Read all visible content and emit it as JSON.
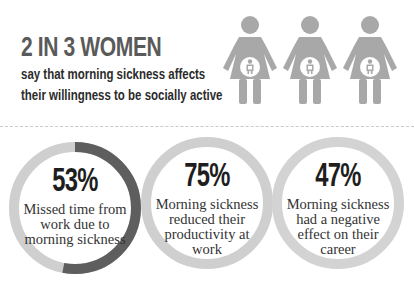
{
  "header": {
    "headline": "2 IN 3 WOMEN",
    "subline_1": "say that morning sickness affects",
    "subline_2": "their willingness to be socially active"
  },
  "pictogram": {
    "icon": "pregnant-woman-icon",
    "count": 3,
    "color": "#a8a8a8"
  },
  "stats": [
    {
      "value": "53%",
      "percent": 53,
      "description": "Missed time from work due to morning sickness",
      "ring_color": "#cfcfcf",
      "fill_color": "#5e5e5e"
    },
    {
      "value": "75%",
      "percent": 75,
      "description": "Morning sickness reduced their productivity at work",
      "ring_color": "#cfcfcf",
      "fill_color": "#cfcfcf"
    },
    {
      "value": "47%",
      "percent": 47,
      "description": "Morning sickness had a negative effect on their career",
      "ring_color": "#d3d3d3",
      "fill_color": "#d3d3d3"
    }
  ],
  "colors": {
    "headline": "#5a5a5a",
    "text": "#2b2b2b",
    "divider": "#c9c9c9"
  }
}
